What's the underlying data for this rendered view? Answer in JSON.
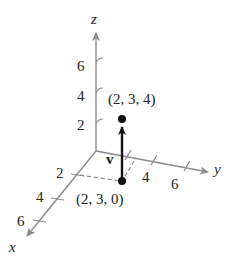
{
  "diagram": {
    "type": "3d-coordinate-vector",
    "axes": {
      "x": {
        "label": "x",
        "ticks": [
          "2",
          "4",
          "6"
        ]
      },
      "y": {
        "label": "y",
        "ticks": [
          "4",
          "6"
        ]
      },
      "z": {
        "label": "z",
        "ticks": [
          "6",
          "4",
          "2"
        ]
      }
    },
    "points": [
      {
        "label": "(2, 3, 4)",
        "coords": [
          2,
          3,
          4
        ]
      },
      {
        "label": "(2, 3, 0)",
        "coords": [
          2,
          3,
          0
        ]
      }
    ],
    "vector": {
      "label": "v",
      "from": [
        2,
        3,
        0
      ],
      "to": [
        2,
        3,
        4
      ]
    },
    "colors": {
      "axis": "#8a8a8a",
      "vector": "#111111",
      "text": "#222222"
    }
  }
}
